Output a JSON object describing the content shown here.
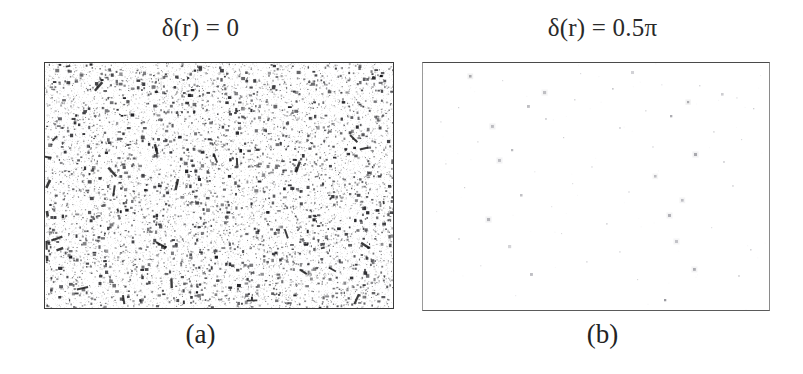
{
  "figure": {
    "background_color": "#ffffff",
    "panel_count": 2,
    "width": 803,
    "height": 374
  },
  "panels": [
    {
      "id": "panel-a",
      "title": "δ(r) = 0",
      "caption": "(a)",
      "frame": {
        "x": 44,
        "y": 62,
        "width": 348,
        "height": 245
      },
      "border_color": "#3a3a3a",
      "field_type": "dense-speckle",
      "field_background": "#ffffff",
      "speckle_color": "#2b2b2b",
      "speckle_count": 5200
    },
    {
      "id": "panel-b",
      "title": "δ(r) = 0.5π",
      "caption": "(b)",
      "frame": {
        "x": 422,
        "y": 62,
        "width": 346,
        "height": 247
      },
      "border_color": "#5a5a5a",
      "field_type": "sparse-speckle",
      "field_background": "#ffffff",
      "speckle_color": "#8e8e96",
      "speckle_count": 62
    }
  ],
  "chart_data": {
    "type": "scatter",
    "title": "",
    "subtitle": "",
    "xlabel": "",
    "ylabel": "",
    "grid": false,
    "legend": null,
    "panels": [
      {
        "label": "(a)",
        "annotation": "δ(r) = 0",
        "description": "Dense random speckle / grain field filling the framed region almost uniformly",
        "point_count": 5200,
        "point_color": "#2b2b2b",
        "point_size_px": [
          1,
          3
        ],
        "fill_fraction": 0.34,
        "xlim": [
          0,
          348
        ],
        "ylim": [
          0,
          245
        ]
      },
      {
        "label": "(b)",
        "annotation": "δ(r) = 0.5π",
        "description": "Nearly empty white field with very sparse faint gray dots",
        "point_count": 62,
        "point_color": "#8e8e96",
        "point_size_px": [
          1,
          3
        ],
        "fill_fraction": 0.0012,
        "xlim": [
          0,
          346
        ],
        "ylim": [
          0,
          247
        ],
        "points": [
          [
            46,
            12
          ],
          [
            79,
            17
          ],
          [
            157,
            10
          ],
          [
            208,
            8
          ],
          [
            276,
            22
          ],
          [
            337,
            12
          ],
          [
            120,
            28
          ],
          [
            189,
            25
          ],
          [
            238,
            21
          ],
          [
            298,
            30
          ],
          [
            313,
            34
          ],
          [
            35,
            44
          ],
          [
            104,
            42
          ],
          [
            151,
            36
          ],
          [
            222,
            47
          ],
          [
            264,
            38
          ],
          [
            330,
            45
          ],
          [
            17,
            58
          ],
          [
            68,
            62
          ],
          [
            122,
            55
          ],
          [
            196,
            64
          ],
          [
            247,
            52
          ],
          [
            290,
            68
          ],
          [
            54,
            78
          ],
          [
            88,
            86
          ],
          [
            140,
            74
          ],
          [
            229,
            83
          ],
          [
            271,
            90
          ],
          [
            318,
            76
          ],
          [
            22,
            100
          ],
          [
            75,
            96
          ],
          [
            111,
            108
          ],
          [
            168,
            103
          ],
          [
            231,
            112
          ],
          [
            300,
            98
          ],
          [
            41,
            124
          ],
          [
            97,
            131
          ],
          [
            149,
            120
          ],
          [
            205,
            128
          ],
          [
            258,
            136
          ],
          [
            309,
            122
          ],
          [
            13,
            148
          ],
          [
            64,
            155
          ],
          [
            128,
            143
          ],
          [
            183,
            160
          ],
          [
            245,
            151
          ],
          [
            288,
            164
          ],
          [
            35,
            175
          ],
          [
            85,
            182
          ],
          [
            138,
            170
          ],
          [
            196,
            188
          ],
          [
            252,
            177
          ],
          [
            327,
            186
          ],
          [
            57,
            202
          ],
          [
            107,
            210
          ],
          [
            163,
            198
          ],
          [
            214,
            216
          ],
          [
            270,
            205
          ],
          [
            315,
            212
          ],
          [
            92,
            232
          ],
          [
            241,
            236
          ]
        ]
      }
    ]
  }
}
